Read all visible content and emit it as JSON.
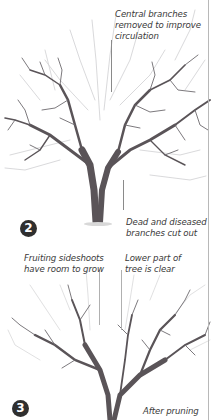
{
  "figure": {
    "stage2": {
      "badge": "2",
      "labels": {
        "central_branches": [
          "Central branches",
          "removed to improve",
          "circulation"
        ],
        "dead_diseased": [
          "Dead and diseased",
          "branches cut out"
        ]
      }
    },
    "stage3": {
      "badge": "3",
      "labels": {
        "fruiting_sideshoots": [
          "Fruiting sideshoots",
          "have room to grow"
        ],
        "lower_part": [
          "Lower part of",
          "tree is clear"
        ],
        "caption": "After pruning"
      }
    },
    "colors": {
      "branch_dark": "#5a5458",
      "branch_light": "#c9c9cc",
      "text": "#3a3a3a",
      "badge": "#2f2f2f",
      "divider": "#b8b8b8"
    }
  }
}
